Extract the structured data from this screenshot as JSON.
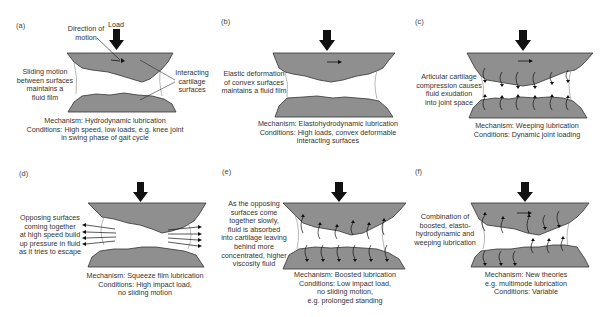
{
  "figure": {
    "colors": {
      "cartilage_fill": "#8f8f8f",
      "cartilage_stroke": "#333333",
      "fluid_fill": "#ffffff",
      "arrow": "#111111",
      "text": "#333333"
    },
    "panels": [
      {
        "letter": "(a)",
        "annotations": {
          "load": "Load",
          "direction": [
            "Direction of",
            "motion"
          ],
          "left": [
            "Sliding motion",
            "between surfaces",
            "maintains a",
            "fluid film"
          ],
          "right": [
            "Interacting",
            "cartilage",
            "surfaces"
          ]
        },
        "caption": [
          "Mechanism: Hydrodynamic lubrication",
          "Conditions: High speed, low loads, e.g. knee joint",
          "in swing phase of gait cycle"
        ]
      },
      {
        "letter": "(b)",
        "annotations": {
          "left": [
            "Elastic deformation",
            "of convex surfaces",
            "maintains a fluid film"
          ]
        },
        "caption": [
          "Mechanism: Elastohydrodynamic lubrication",
          "Conditions: High loads, convex deformable",
          "interacting surfaces"
        ]
      },
      {
        "letter": "(c)",
        "annotations": {
          "left": [
            "Articular cartilage",
            "compression causes",
            "fluid exudation",
            "into joint space"
          ]
        },
        "caption": [
          "Mechanism: Weeping lubrication",
          "Conditions: Dynamic joint loading"
        ]
      },
      {
        "letter": "(d)",
        "annotations": {
          "left": [
            "Opposing surfaces",
            "coming together",
            "at high speed build",
            "up pressure in fluid",
            "as it tries to escape"
          ]
        },
        "caption": [
          "Mechanism: Squeeze film lubrication",
          "Conditions: High impact load,",
          "no sliding motion"
        ]
      },
      {
        "letter": "(e)",
        "annotations": {
          "left": [
            "As the opposing",
            "surfaces come",
            "together slowly,",
            "fluid is absorbed",
            "into cartilage leaving",
            "behind more",
            "concentrated, higher",
            "viscosity fluid"
          ]
        },
        "caption": [
          "Mechanism: Boosted lubrication",
          "Conditions: Low impact load,",
          "no sliding motion,",
          "e.g. prolonged standing"
        ]
      },
      {
        "letter": "(f)",
        "annotations": {
          "left": [
            "Combination of",
            "boosted, elasto-",
            "hydrodynamic and",
            "weeping lubrication"
          ]
        },
        "caption": [
          "Mechanism: New theories",
          "e.g. multimode lubrication",
          "Conditions: Variable"
        ]
      }
    ]
  }
}
